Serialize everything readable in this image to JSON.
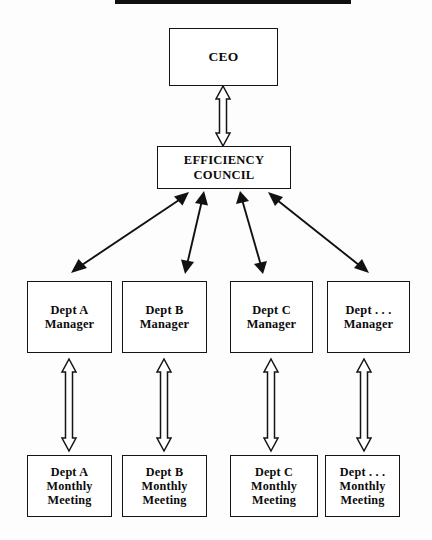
{
  "diagram": {
    "title_rule": "black-horizontal-rule",
    "background_color": "#fdfdfd",
    "line_color": "#141414",
    "box_fill": "#ffffff",
    "levels": {
      "executive": {
        "nodes": [
          {
            "id": "ceo",
            "label": "CEO"
          }
        ]
      },
      "council": {
        "nodes": [
          {
            "id": "council",
            "label": "EFFICIENCY\nCOUNCIL"
          }
        ]
      },
      "managers": {
        "nodes": [
          {
            "id": "mgr-a",
            "label": "Dept A\nManager"
          },
          {
            "id": "mgr-b",
            "label": "Dept B\nManager"
          },
          {
            "id": "mgr-c",
            "label": "Dept C\nManager"
          },
          {
            "id": "mgr-d",
            "label": "Dept . . .\nManager"
          }
        ]
      },
      "meetings": {
        "nodes": [
          {
            "id": "meet-a",
            "label": "Dept A\nMonthly\nMeeting"
          },
          {
            "id": "meet-b",
            "label": "Dept B\nMonthly\nMeeting"
          },
          {
            "id": "meet-c",
            "label": "Dept C\nMonthly\nMeeting"
          },
          {
            "id": "meet-d",
            "label": "Dept . . .\nMonthly\nMeeting"
          }
        ]
      }
    },
    "connectors": [
      {
        "id": "ceo-council",
        "style": "hollow-block-double-arrow",
        "orientation": "vertical",
        "from": "ceo",
        "to": "council"
      },
      {
        "id": "council-mgr-a",
        "style": "solid-line-double-arrow",
        "orientation": "diagonal",
        "from": "council",
        "to": "mgr-a"
      },
      {
        "id": "council-mgr-b",
        "style": "solid-line-double-arrow",
        "orientation": "diagonal",
        "from": "council",
        "to": "mgr-b"
      },
      {
        "id": "council-mgr-c",
        "style": "solid-line-double-arrow",
        "orientation": "diagonal",
        "from": "council",
        "to": "mgr-c"
      },
      {
        "id": "council-mgr-d",
        "style": "solid-line-double-arrow",
        "orientation": "diagonal",
        "from": "council",
        "to": "mgr-d"
      },
      {
        "id": "mgr-a-meet-a",
        "style": "hollow-block-double-arrow",
        "orientation": "vertical",
        "from": "mgr-a",
        "to": "meet-a"
      },
      {
        "id": "mgr-b-meet-b",
        "style": "hollow-block-double-arrow",
        "orientation": "vertical",
        "from": "mgr-b",
        "to": "meet-b"
      },
      {
        "id": "mgr-c-meet-c",
        "style": "hollow-block-double-arrow",
        "orientation": "vertical",
        "from": "mgr-c",
        "to": "meet-c"
      },
      {
        "id": "mgr-d-meet-d",
        "style": "hollow-block-double-arrow",
        "orientation": "vertical",
        "from": "mgr-d",
        "to": "meet-d"
      }
    ]
  }
}
